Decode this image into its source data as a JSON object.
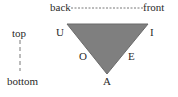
{
  "diagram": {
    "type": "vowel-triangle",
    "axes": {
      "horizontal": {
        "left": "back",
        "right": "front"
      },
      "vertical": {
        "top": "top",
        "bottom": "bottom"
      }
    },
    "vowels": {
      "u": "U",
      "i": "I",
      "o": "O",
      "e": "E",
      "a": "A"
    },
    "colors": {
      "triangle_fill": "#7f7f7f",
      "triangle_stroke": "#6a6a6a",
      "text": "#2a2a2a"
    }
  }
}
